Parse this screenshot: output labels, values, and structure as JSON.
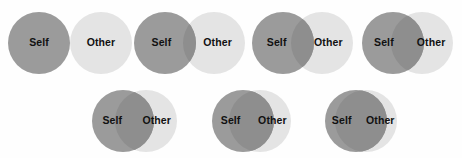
{
  "scale": {
    "name": "Inclusion of Other in the Self Scale",
    "background_color": "#fefefe",
    "self_label": "Self",
    "other_label": "Other",
    "colors": {
      "self_fill": "#9b9b9b",
      "other_fill": "#e4e4e4",
      "overlap_fill": "#8e8e8e",
      "label_text": "#111111"
    },
    "geometry": {
      "radius": 31,
      "rows": 2
    },
    "pairs": [
      {
        "index": 1,
        "overlap_px": 0,
        "row": 1,
        "x": 8,
        "y": 12,
        "self_label": "Self",
        "other_label": "Other"
      },
      {
        "index": 2,
        "overlap_px": 13,
        "row": 1,
        "x": 134,
        "y": 12,
        "self_label": "Self",
        "other_label": "Other"
      },
      {
        "index": 3,
        "overlap_px": 23,
        "row": 1,
        "x": 252,
        "y": 12,
        "self_label": "Self",
        "other_label": "Other"
      },
      {
        "index": 4,
        "overlap_px": 33,
        "row": 1,
        "x": 362,
        "y": 12,
        "self_label": "Self",
        "other_label": "Other"
      },
      {
        "index": 5,
        "overlap_px": 39,
        "row": 2,
        "x": 92,
        "y": 90,
        "self_label": "Self",
        "other_label": "Other"
      },
      {
        "index": 6,
        "overlap_px": 45,
        "row": 2,
        "x": 212,
        "y": 90,
        "self_label": "Self",
        "other_label": "Other"
      },
      {
        "index": 7,
        "overlap_px": 52,
        "row": 2,
        "x": 325,
        "y": 90,
        "self_label": "Self",
        "other_label": "Other"
      }
    ]
  }
}
